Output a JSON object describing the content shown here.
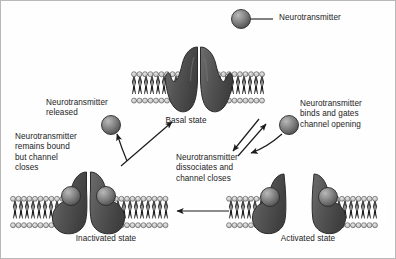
{
  "figure": {
    "background_color": "#fefefe",
    "border_color": "#b8b8b8"
  },
  "legend": {
    "marker_name": "neurotransmitter-sphere",
    "label": "Neurotransmitter",
    "marker_color": "#6e6e6e",
    "leader_color": "#1b1b1b"
  },
  "colors": {
    "receptor_fill": "#5a5a5a",
    "receptor_edge": "#2b2b2b",
    "neurotransmitter_fill": "#757575",
    "neurotransmitter_edge": "#2b2b2b",
    "membrane_head": "#cfcfcf",
    "membrane_head_edge": "#3a3a3a",
    "membrane_tail": "#1b1b1b",
    "text": "#1b1b1b",
    "arrow": "#1b1b1b"
  },
  "states": [
    {
      "id": "basal",
      "label": "Basal state",
      "channel": "closed",
      "bound_neurotransmitters": 0,
      "position": "top-center"
    },
    {
      "id": "activated",
      "label": "Activated state",
      "channel": "open",
      "bound_neurotransmitters": 2,
      "position": "bottom-right"
    },
    {
      "id": "inactivated",
      "label": "Inactivated state",
      "channel": "closed",
      "bound_neurotransmitters": 2,
      "position": "bottom-left"
    }
  ],
  "annotations": [
    {
      "id": "binds-and-gates",
      "text": "Neurotransmitter\nbinds and gates\nchannel opening",
      "describes_transition": "basal-to-activated"
    },
    {
      "id": "dissociates-and-closes",
      "text": "Neurotransmitter\ndissociates and\nchannel closes",
      "describes_transition": "activated-to-basal"
    },
    {
      "id": "remains-bound",
      "text": "Neurotransmitter\nremains bound\nbut channel\ncloses",
      "describes_transition": "activated-to-inactivated"
    },
    {
      "id": "released",
      "text": "Neurotransmitter\nreleased",
      "describes_transition": "inactivated-to-basal"
    }
  ],
  "transitions": [
    {
      "id": "basal-to-activated",
      "from": "basal",
      "to": "activated",
      "arrow": "diagonal-down-right"
    },
    {
      "id": "activated-to-basal",
      "from": "activated",
      "to": "basal",
      "arrow": "diagonal-up-left"
    },
    {
      "id": "activated-to-inactivated",
      "from": "activated",
      "to": "inactivated",
      "arrow": "horizontal-left"
    },
    {
      "id": "inactivated-to-basal",
      "from": "inactivated",
      "to": "basal",
      "arrow": "diagonal-up-right"
    },
    {
      "id": "inactivated-release",
      "from": "inactivated",
      "to": "free-neurotransmitter",
      "arrow": "curve-up-left"
    }
  ],
  "free_neurotransmitters": [
    {
      "id": "released-nt",
      "near": "inactivated"
    },
    {
      "id": "incoming-nt",
      "near": "activated"
    }
  ]
}
